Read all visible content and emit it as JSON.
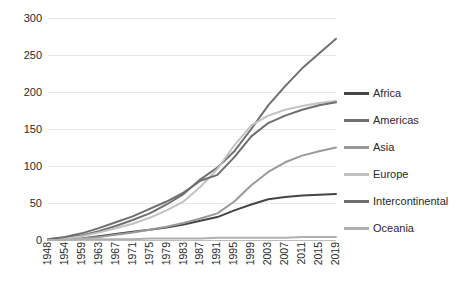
{
  "chart_data": {
    "type": "line",
    "title": "",
    "subtitle": "",
    "xlabel": "",
    "ylabel": "",
    "grid": true,
    "legend_position": "right",
    "ylim": [
      0,
      300
    ],
    "yticks": [
      0,
      50,
      100,
      150,
      200,
      250,
      300
    ],
    "xticks": [
      "1948",
      "1954",
      "1959",
      "1963",
      "1967",
      "1971",
      "1975",
      "1979",
      "1983",
      "1987",
      "1991",
      "1995",
      "1999",
      "2003",
      "2007",
      "2011",
      "2015",
      "2019"
    ],
    "x": [
      1948,
      1954,
      1959,
      1963,
      1967,
      1971,
      1975,
      1979,
      1983,
      1987,
      1991,
      1995,
      1999,
      2003,
      2007,
      2011,
      2015,
      2019
    ],
    "series": [
      {
        "name": "Africa",
        "color": "#454545",
        "values": [
          0,
          1,
          2,
          5,
          8,
          11,
          14,
          17,
          21,
          26,
          31,
          40,
          48,
          55,
          58,
          60,
          61,
          62
        ]
      },
      {
        "name": "Americas",
        "color": "#707070",
        "values": [
          1,
          3,
          6,
          12,
          19,
          27,
          36,
          48,
          62,
          82,
          98,
          120,
          150,
          182,
          208,
          232,
          252,
          272
        ]
      },
      {
        "name": "Asia",
        "color": "#9a9a9a",
        "values": [
          0,
          1,
          2,
          4,
          7,
          10,
          14,
          18,
          23,
          29,
          36,
          52,
          74,
          92,
          105,
          114,
          120,
          125
        ]
      },
      {
        "name": "Europe",
        "color": "#c2c2c2",
        "values": [
          1,
          2,
          5,
          10,
          16,
          22,
          30,
          40,
          52,
          72,
          96,
          128,
          155,
          168,
          176,
          181,
          185,
          188
        ]
      },
      {
        "name": "Intercontinental",
        "color": "#6e6e6e",
        "values": [
          1,
          4,
          9,
          16,
          24,
          32,
          42,
          52,
          64,
          80,
          88,
          112,
          140,
          158,
          168,
          176,
          182,
          186
        ]
      },
      {
        "name": "Oceania",
        "color": "#b0b0b0",
        "values": [
          0,
          0,
          1,
          1,
          1,
          1,
          2,
          2,
          2,
          2,
          3,
          3,
          3,
          3,
          3,
          4,
          4,
          4
        ]
      }
    ]
  },
  "axes": {
    "y_tick_labels": [
      "300",
      "250",
      "200",
      "150",
      "100",
      "50",
      "0"
    ],
    "x_tick_labels": [
      "1948",
      "1954",
      "1959",
      "1963",
      "1967",
      "1971",
      "1975",
      "1979",
      "1983",
      "1987",
      "1991",
      "1995",
      "1999",
      "2003",
      "2007",
      "2011",
      "2015",
      "2019"
    ]
  },
  "legend": {
    "items": [
      {
        "label": "Africa",
        "color": "#454545"
      },
      {
        "label": "Americas",
        "color": "#707070"
      },
      {
        "label": "Asia",
        "color": "#9a9a9a"
      },
      {
        "label": "Europe",
        "color": "#c2c2c2"
      },
      {
        "label": "Intercontinental",
        "color": "#6e6e6e"
      },
      {
        "label": "Oceania",
        "color": "#b0b0b0"
      }
    ]
  },
  "colors": {
    "gridline": "#e8e8e8",
    "axis": "#bdbdbd",
    "text": "#2a2a2a",
    "background": "#ffffff"
  }
}
